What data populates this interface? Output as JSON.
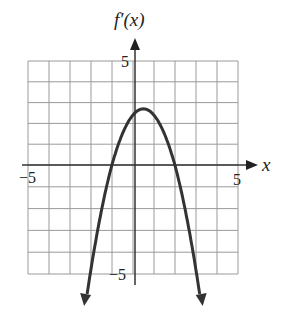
{
  "chart_data": {
    "type": "line",
    "title": "",
    "ylabel": "f′(x)",
    "xlabel": "x",
    "xlim": [
      -5,
      5
    ],
    "ylim": [
      -5,
      5
    ],
    "grid": true,
    "grid_step": 1,
    "x_tick_labels": [
      "-5",
      "5"
    ],
    "y_tick_labels": [
      "5",
      "-5"
    ],
    "series": [
      {
        "name": "f′(x)",
        "description": "downward-opening parabola, vertex ≈ (0.4, 2.7), roots ≈ -1.1 and 1.9, arrows at both ends going down",
        "equation_approx": "y = 2.7 - 1.2(x - 0.4)^2",
        "x": [
          -2.3,
          -2,
          -1.5,
          -1.1,
          -0.5,
          0,
          0.4,
          1,
          1.5,
          1.9,
          2.5,
          3,
          3.1
        ],
        "y": [
          -6.0,
          -4.8,
          -1.6,
          0.0,
          1.7,
          2.5,
          2.7,
          2.3,
          1.2,
          0.0,
          -2.6,
          -5.4,
          -6.0
        ]
      }
    ]
  },
  "labels": {
    "y_axis": "f′(x)",
    "x_axis": "x",
    "x_min": "−5",
    "x_max": "5",
    "y_max": "5",
    "y_min": "−5"
  }
}
